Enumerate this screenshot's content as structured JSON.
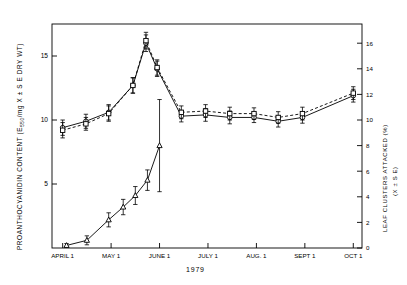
{
  "chart_data": {
    "type": "line",
    "title": "",
    "xlabel": "1979",
    "ylabel_left": "PROANTHOCYANIDIN CONTENT (E  /mg X ± S E DRY WT)",
    "ylabel_left_part1": "PROANTHOCYANIDIN CONTENT (E",
    "ylabel_left_sub": "550",
    "ylabel_left_part2": "/mg X ± S E DRY WT)",
    "ylabel_right": "LEAF CLUSTERS ATTACKED (%)",
    "ylabel_right_sub": "(X ± S E)",
    "grid": false,
    "legend": "none",
    "ylim_left": [
      0,
      17.5
    ],
    "yticks_left": [
      5,
      10,
      15
    ],
    "ytick_labels_left": [
      "5",
      "10",
      "15"
    ],
    "ylim_right": [
      0,
      17.5
    ],
    "yticks_right": [
      0,
      2,
      4,
      6,
      8,
      10,
      12,
      14,
      16
    ],
    "ytick_labels_right": [
      "0",
      "2",
      "4",
      "6",
      "8",
      "10",
      "12",
      "14",
      "16"
    ],
    "xtick_labels": [
      "APRIL 1",
      "MAY 1",
      "JUNE 1",
      "JULY 1",
      "AUG. 1",
      "SEPT 1",
      "OCT 1"
    ],
    "series": [
      {
        "name": "proanthocyanidin-solid",
        "marker": "circle",
        "linestyle": "solid",
        "x": [
          0.0,
          0.48,
          0.95,
          1.45,
          1.72,
          1.95,
          2.45,
          2.95,
          3.45,
          3.95,
          4.45,
          4.95,
          6.0
        ],
        "values": [
          9.4,
          9.9,
          10.6,
          12.7,
          16.0,
          14.0,
          10.3,
          10.4,
          10.2,
          10.2,
          9.9,
          10.2,
          11.9
        ],
        "errors": [
          0.6,
          0.55,
          0.6,
          0.6,
          0.65,
          0.6,
          0.45,
          0.5,
          0.5,
          0.4,
          0.45,
          0.45,
          0.5
        ]
      },
      {
        "name": "proanthocyanidin-dashed",
        "marker": "square",
        "linestyle": "dashed",
        "x": [
          0.0,
          0.48,
          0.95,
          1.45,
          1.72,
          1.95,
          2.45,
          2.95,
          3.45,
          3.95,
          4.45,
          4.95,
          6.0
        ],
        "values": [
          9.2,
          9.7,
          10.5,
          12.7,
          16.2,
          14.1,
          10.6,
          10.7,
          10.5,
          10.5,
          10.2,
          10.5,
          12.1
        ],
        "errors": [
          0.6,
          0.5,
          0.6,
          0.6,
          0.65,
          0.6,
          0.5,
          0.5,
          0.5,
          0.45,
          0.45,
          0.5,
          0.5
        ]
      },
      {
        "name": "leaf-clusters-attacked",
        "marker": "triangle",
        "linestyle": "solid",
        "x": [
          0.08,
          0.5,
          0.95,
          1.25,
          1.5,
          1.75,
          2.0
        ],
        "values": [
          0.2,
          0.6,
          2.2,
          3.2,
          4.1,
          5.3,
          8.0
        ],
        "errors": [
          0.15,
          0.35,
          0.55,
          0.6,
          0.7,
          0.8,
          3.6
        ]
      }
    ]
  }
}
